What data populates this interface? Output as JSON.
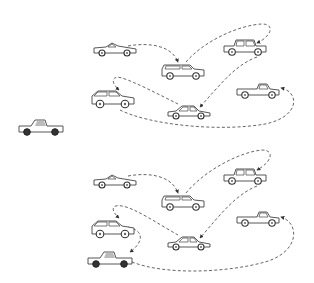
{
  "diagram": {
    "stroke_color": "#555555",
    "background": "#ffffff",
    "standalone_vehicle": {
      "type": "pickup-truck",
      "x": 17,
      "y": 117
    },
    "panels": [
      {
        "name": "top-route",
        "vehicles": [
          {
            "id": "t-sports",
            "type": "sports-car",
            "x": 92,
            "y": 40
          },
          {
            "id": "t-wagon",
            "type": "station-wagon",
            "x": 160,
            "y": 62
          },
          {
            "id": "t-sedan",
            "type": "classic-sedan",
            "x": 222,
            "y": 38
          },
          {
            "id": "t-suv",
            "type": "suv",
            "x": 90,
            "y": 88
          },
          {
            "id": "t-coupe",
            "type": "coupe",
            "x": 166,
            "y": 104
          },
          {
            "id": "t-pickup",
            "type": "pickup-truck",
            "x": 235,
            "y": 82
          }
        ],
        "edges": [
          {
            "from": "t-sports",
            "to": "t-wagon"
          },
          {
            "from": "t-wagon",
            "to": "t-sedan"
          },
          {
            "from": "t-sedan",
            "to": "t-coupe"
          },
          {
            "from": "t-coupe",
            "to": "t-suv"
          },
          {
            "from": "t-suv",
            "to": "t-pickup"
          }
        ]
      },
      {
        "name": "bottom-route",
        "vehicles": [
          {
            "id": "b-sports",
            "type": "sports-car",
            "x": 92,
            "y": 172
          },
          {
            "id": "b-wagon",
            "type": "station-wagon",
            "x": 160,
            "y": 193
          },
          {
            "id": "b-sedan",
            "type": "classic-sedan",
            "x": 222,
            "y": 167
          },
          {
            "id": "b-suv",
            "type": "suv",
            "x": 90,
            "y": 218
          },
          {
            "id": "b-coupe",
            "type": "coupe",
            "x": 166,
            "y": 235
          },
          {
            "id": "b-pickup",
            "type": "pickup-truck",
            "x": 235,
            "y": 210
          },
          {
            "id": "b-pickup2",
            "type": "pickup-truck",
            "x": 86,
            "y": 249
          }
        ],
        "edges": [
          {
            "from": "b-sports",
            "to": "b-wagon"
          },
          {
            "from": "b-wagon",
            "to": "b-sedan"
          },
          {
            "from": "b-sedan",
            "to": "b-coupe"
          },
          {
            "from": "b-coupe",
            "to": "b-suv"
          },
          {
            "from": "b-suv",
            "to": "b-pickup2"
          },
          {
            "from": "b-pickup2",
            "to": "b-pickup"
          }
        ]
      }
    ]
  }
}
